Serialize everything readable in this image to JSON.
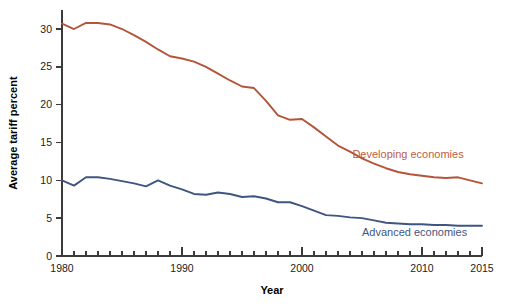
{
  "chart_data": {
    "type": "line",
    "title": "",
    "xlabel": "Year",
    "ylabel": "Average tariff percent",
    "xlim": [
      1980,
      2015
    ],
    "ylim": [
      0,
      32.5
    ],
    "yticks": [
      0,
      5,
      10,
      15,
      20,
      25,
      30
    ],
    "xticks_major": [
      1980,
      1990,
      2000,
      2010,
      2015
    ],
    "xtick_interval_minor": 1,
    "grid": false,
    "legend_position": "inline-right",
    "x": [
      1980,
      1981,
      1982,
      1983,
      1984,
      1985,
      1986,
      1987,
      1988,
      1989,
      1990,
      1991,
      1992,
      1993,
      1994,
      1995,
      1996,
      1997,
      1998,
      1999,
      2000,
      2001,
      2002,
      2003,
      2004,
      2005,
      2006,
      2007,
      2008,
      2009,
      2010,
      2011,
      2012,
      2013,
      2014,
      2015
    ],
    "series": [
      {
        "name": "Developing economies",
        "color": "#b4553a",
        "label_color": "#c0603f",
        "values": [
          30.7,
          30.0,
          30.8,
          30.8,
          30.6,
          30.0,
          29.2,
          28.3,
          27.3,
          26.4,
          26.1,
          25.7,
          25.0,
          24.1,
          23.2,
          22.4,
          22.2,
          20.5,
          18.6,
          18.0,
          18.1,
          17.0,
          15.8,
          14.6,
          13.8,
          12.9,
          12.2,
          11.6,
          11.1,
          10.8,
          10.6,
          10.4,
          10.3,
          10.4,
          10.0,
          9.6
        ]
      },
      {
        "name": "Advanced economies",
        "color": "#3f5681",
        "label_color": "#3f5681",
        "values": [
          10.0,
          9.3,
          10.4,
          10.4,
          10.2,
          9.9,
          9.6,
          9.2,
          10.0,
          9.3,
          8.8,
          8.2,
          8.1,
          8.4,
          8.2,
          7.8,
          7.9,
          7.6,
          7.1,
          7.1,
          6.6,
          6.0,
          5.4,
          5.3,
          5.1,
          5.0,
          4.7,
          4.4,
          4.3,
          4.2,
          4.2,
          4.1,
          4.1,
          4.0,
          4.0,
          4.0
        ]
      }
    ],
    "annotations": [
      {
        "text": "Developing economies",
        "x": 2004.2,
        "y": 12.9,
        "color": "#c0603f"
      },
      {
        "text": "Advanced economies",
        "x": 2005.0,
        "y": 2.6,
        "color": "#3f5681"
      }
    ]
  },
  "axes": {
    "y_title": "Average tariff percent",
    "x_title": "Year",
    "y_tick_labels": [
      "0",
      "5",
      "10",
      "15",
      "20",
      "25",
      "30"
    ],
    "x_tick_labels": [
      "1980",
      "1990",
      "2000",
      "2010",
      "2015"
    ]
  },
  "colors": {
    "developing": "#b4553a",
    "advanced": "#3f5681",
    "axis": "#3b3b3b",
    "text": "#1c1c1c",
    "background": "#ffffff"
  }
}
